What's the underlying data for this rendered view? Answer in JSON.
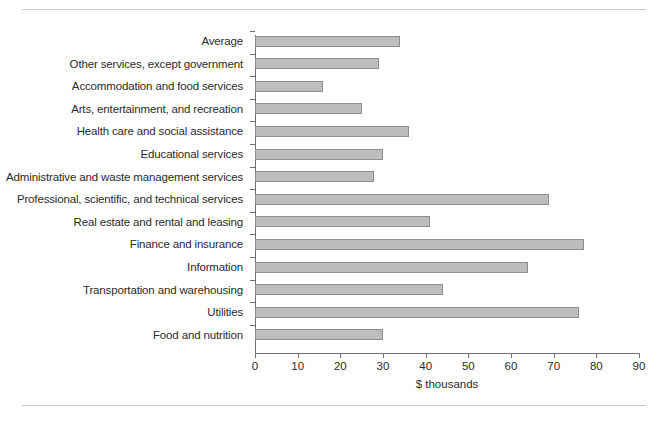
{
  "figure": {
    "background_color": "#ffffff",
    "rule_color": "#c9c9c9",
    "axis_color": "#6f6f6f",
    "text_color": "#2b2b2b"
  },
  "chart_data": {
    "type": "bar",
    "orientation": "horizontal",
    "title": "",
    "subtitle": "",
    "xlabel": "$ thousands",
    "ylabel": "",
    "xlim": [
      0,
      90
    ],
    "xticks": [
      0,
      10,
      20,
      30,
      40,
      50,
      60,
      70,
      80,
      90
    ],
    "xtick_labels": [
      "0",
      "10",
      "20",
      "30",
      "40",
      "50",
      "60",
      "70",
      "80",
      "90"
    ],
    "grid": false,
    "legend": null,
    "bar_color": "#bdbdbd",
    "bar_edge_color": "#8e8e8e",
    "categories": [
      "Average",
      "Other services, except government",
      "Accommodation and food services",
      "Arts, entertainment, and recreation",
      "Health care and social assistance",
      "Educational services",
      "Administrative and waste management services",
      "Professional, scientific, and technical services",
      "Real estate and rental and leasing",
      "Finance and insurance",
      "Information",
      "Transportation and warehousing",
      "Utilities",
      "Food and nutrition"
    ],
    "values": [
      34,
      29,
      16,
      25,
      36,
      30,
      28,
      69,
      41,
      77,
      64,
      44,
      76,
      30
    ]
  }
}
